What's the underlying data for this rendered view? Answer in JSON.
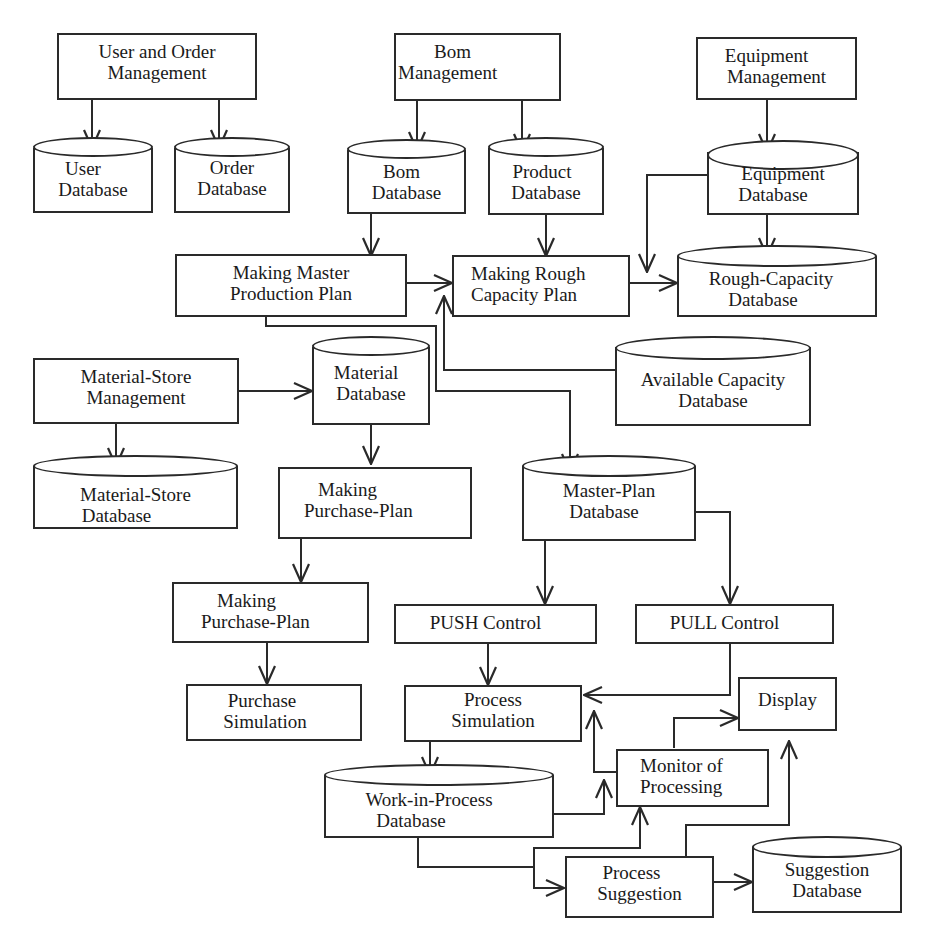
{
  "diagram": {
    "title": "",
    "stroke_color": "#2a2a2a",
    "background": "#ffffff",
    "nodes": {
      "user_order_mgmt": {
        "type": "process",
        "lines": [
          "User and Order",
          "Management"
        ]
      },
      "bom_mgmt": {
        "type": "process",
        "lines": [
          "Bom",
          "Management"
        ]
      },
      "equipment_mgmt": {
        "type": "process",
        "lines": [
          "Equipment",
          "Management"
        ]
      },
      "user_db": {
        "type": "database",
        "lines": [
          "User",
          "Database"
        ]
      },
      "order_db": {
        "type": "database",
        "lines": [
          "Order",
          "Database"
        ]
      },
      "bom_db": {
        "type": "database",
        "lines": [
          "Bom",
          "Database"
        ]
      },
      "product_db": {
        "type": "database",
        "lines": [
          "Product",
          "Database"
        ]
      },
      "equipment_db": {
        "type": "database",
        "lines": [
          "Equipment",
          "Database"
        ]
      },
      "master_plan_proc": {
        "type": "process",
        "lines": [
          "Making Master",
          "Production Plan"
        ]
      },
      "rough_plan_proc": {
        "type": "process",
        "lines": [
          "Making Rough",
          "Capacity Plan"
        ]
      },
      "rough_capacity_db": {
        "type": "database",
        "lines": [
          "Rough-Capacity",
          "Database"
        ]
      },
      "available_capacity_db": {
        "type": "database",
        "lines": [
          "Available Capacity",
          "Database"
        ]
      },
      "material_store_mgmt": {
        "type": "process",
        "lines": [
          "Material-Store",
          "Management"
        ]
      },
      "material_db": {
        "type": "database",
        "lines": [
          "Material",
          "Database"
        ]
      },
      "material_store_db": {
        "type": "database",
        "lines": [
          "Material-Store",
          "Database"
        ]
      },
      "purchase_plan_1": {
        "type": "process",
        "lines": [
          "Making",
          "Purchase-Plan"
        ]
      },
      "master_plan_db": {
        "type": "database",
        "lines": [
          "Master-Plan",
          "Database"
        ]
      },
      "purchase_plan_2": {
        "type": "process",
        "lines": [
          "Making",
          "Purchase-Plan"
        ]
      },
      "push_control": {
        "type": "process",
        "lines": [
          "PUSH Control"
        ]
      },
      "pull_control": {
        "type": "process",
        "lines": [
          "PULL Control"
        ]
      },
      "purchase_sim": {
        "type": "process",
        "lines": [
          "Purchase",
          "Simulation"
        ]
      },
      "process_sim": {
        "type": "process",
        "lines": [
          "Process",
          "Simulation"
        ]
      },
      "display": {
        "type": "process",
        "lines": [
          "Display"
        ]
      },
      "monitor": {
        "type": "process",
        "lines": [
          "Monitor of",
          "Processing"
        ]
      },
      "wip_db": {
        "type": "database",
        "lines": [
          "Work-in-Process",
          "Database"
        ]
      },
      "process_suggestion": {
        "type": "process",
        "lines": [
          "Process",
          "Suggestion"
        ]
      },
      "suggestion_db": {
        "type": "database",
        "lines": [
          "Suggestion",
          "Database"
        ]
      }
    },
    "edges": [
      {
        "from": "user_order_mgmt",
        "to": "user_db"
      },
      {
        "from": "user_order_mgmt",
        "to": "order_db"
      },
      {
        "from": "bom_mgmt",
        "to": "bom_db"
      },
      {
        "from": "bom_mgmt",
        "to": "product_db"
      },
      {
        "from": "equipment_mgmt",
        "to": "equipment_db"
      },
      {
        "from": "bom_db",
        "to": "master_plan_proc"
      },
      {
        "from": "product_db",
        "to": "rough_plan_proc"
      },
      {
        "from": "equipment_db",
        "to": "rough_capacity_db"
      },
      {
        "from": "equipment_db",
        "to": "rough_capacity_db",
        "via": "left"
      },
      {
        "from": "master_plan_proc",
        "to": "rough_plan_proc"
      },
      {
        "from": "rough_plan_proc",
        "to": "rough_capacity_db"
      },
      {
        "from": "available_capacity_db",
        "to": "rough_plan_proc"
      },
      {
        "from": "master_plan_proc",
        "to": "master_plan_db"
      },
      {
        "from": "material_store_mgmt",
        "to": "material_db"
      },
      {
        "from": "material_store_mgmt",
        "to": "material_store_db"
      },
      {
        "from": "material_db",
        "to": "purchase_plan_1"
      },
      {
        "from": "purchase_plan_1",
        "to": "purchase_plan_2"
      },
      {
        "from": "purchase_plan_2",
        "to": "purchase_sim"
      },
      {
        "from": "master_plan_db",
        "to": "push_control"
      },
      {
        "from": "master_plan_db",
        "to": "pull_control"
      },
      {
        "from": "push_control",
        "to": "process_sim"
      },
      {
        "from": "pull_control",
        "to": "process_sim"
      },
      {
        "from": "process_sim",
        "to": "wip_db"
      },
      {
        "from": "wip_db",
        "to": "monitor"
      },
      {
        "from": "wip_db",
        "to": "process_suggestion"
      },
      {
        "from": "monitor",
        "to": "process_sim"
      },
      {
        "from": "monitor",
        "to": "display"
      },
      {
        "from": "process_suggestion",
        "to": "monitor"
      },
      {
        "from": "process_suggestion",
        "to": "display"
      },
      {
        "from": "process_suggestion",
        "to": "suggestion_db"
      }
    ]
  }
}
